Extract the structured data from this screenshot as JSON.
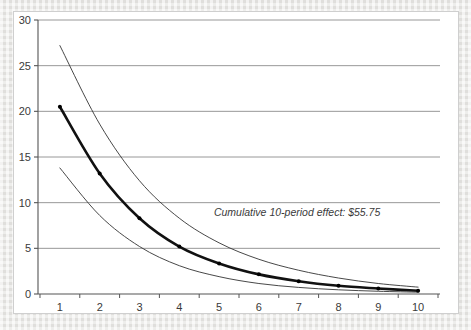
{
  "figure": {
    "background_color": "#e8e7e4",
    "plate_color": "#ffffff",
    "plate_border_color": "#cfcfcf"
  },
  "annotation": {
    "text": "Cumulative 10-period effect: $55.75",
    "x_value": 9.05,
    "y_value": 8.6
  },
  "style": {
    "axis_color": "#555555",
    "grid_color": "#8c8c8c",
    "main_series_color": "#111111",
    "band_series_color": "#333333",
    "marker_color": "#000000",
    "main_line_width": 2.6,
    "band_line_width": 0.9,
    "marker_radius": 2.0
  },
  "chart_data": {
    "type": "line",
    "title": "",
    "xlabel": "",
    "ylabel": "",
    "xlim": [
      0.45,
      10.55
    ],
    "ylim": [
      0,
      30
    ],
    "xticks": [
      1,
      2,
      3,
      4,
      5,
      6,
      7,
      8,
      9,
      10
    ],
    "yticks": [
      0,
      5,
      10,
      15,
      20,
      25,
      30
    ],
    "xtick_labels": [
      "1",
      "2",
      "3",
      "4",
      "5",
      "6",
      "7",
      "8",
      "9",
      "10"
    ],
    "ytick_labels": [
      "0",
      "5",
      "10",
      "15",
      "20",
      "25",
      "30"
    ],
    "grid": "horizontal",
    "legend": "none",
    "x": [
      1,
      2,
      3,
      4,
      5,
      6,
      7,
      8,
      9,
      10
    ],
    "series": [
      {
        "name": "upper-band",
        "values": [
          27.2,
          18.6,
          12.4,
          8.3,
          5.6,
          3.8,
          2.6,
          1.75,
          1.15,
          0.75
        ],
        "markers": false,
        "emphasis": false
      },
      {
        "name": "period-effect",
        "values": [
          20.5,
          13.2,
          8.3,
          5.2,
          3.35,
          2.15,
          1.4,
          0.9,
          0.6,
          0.35
        ],
        "markers": true,
        "emphasis": true
      },
      {
        "name": "lower-band",
        "values": [
          13.8,
          8.6,
          5.2,
          3.1,
          1.9,
          1.15,
          0.72,
          0.46,
          0.3,
          0.2
        ],
        "markers": false,
        "emphasis": false
      }
    ]
  }
}
